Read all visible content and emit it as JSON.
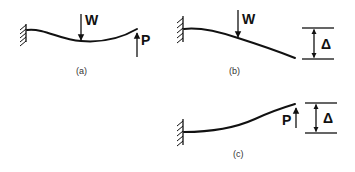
{
  "diagrams": [
    {
      "id": "a",
      "caption": "(a)",
      "description": "Cantilever beam with downward load W at midspan and upward load P at free end",
      "loads": [
        {
          "label": "W",
          "direction": "down"
        },
        {
          "label": "P",
          "direction": "up"
        }
      ]
    },
    {
      "id": "b",
      "caption": "(b)",
      "description": "Cantilever beam with downward load W producing tip deflection",
      "loads": [
        {
          "label": "W",
          "direction": "down"
        }
      ],
      "deflection_label": "Δ"
    },
    {
      "id": "c",
      "caption": "(c)",
      "description": "Cantilever beam with upward load P at free end producing tip deflection",
      "loads": [
        {
          "label": "P",
          "direction": "up"
        }
      ],
      "deflection_label": "Δ"
    }
  ],
  "colors": {
    "line": "#111111",
    "background": "#ffffff"
  }
}
